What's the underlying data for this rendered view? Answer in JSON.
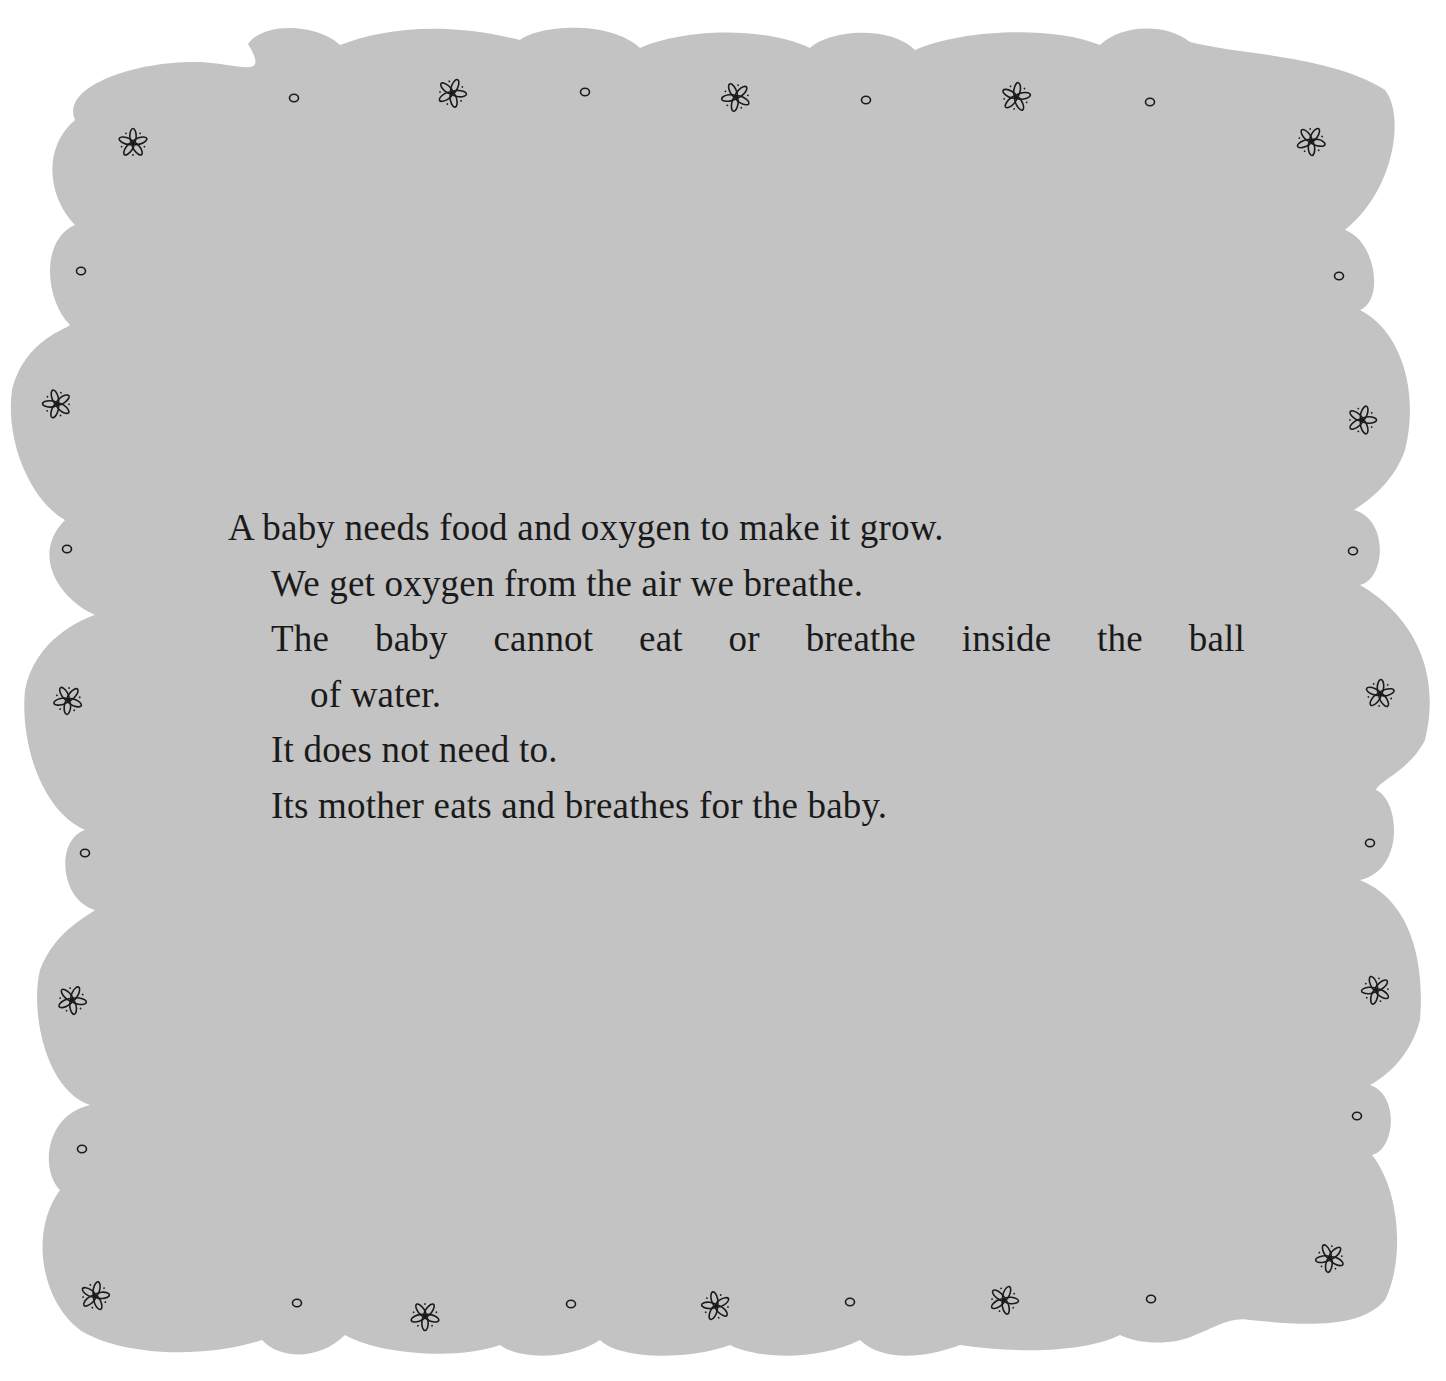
{
  "page": {
    "background_color": "#ffffff",
    "panel_color": "#c3c3c3",
    "ink_color": "#1a1a1a"
  },
  "text": {
    "lines": [
      "A baby needs food and oxygen to make it grow.",
      "We get oxygen from the air we breathe.",
      "The baby cannot eat or breathe inside the ball",
      "of water.",
      "It does not need to.",
      "Its mother eats and breathes for the baby."
    ]
  },
  "decorations": {
    "flower_icon": "six-petal-flower",
    "circle_icon": "small-circle",
    "flowers": [
      {
        "x": 133,
        "y": 143
      },
      {
        "x": 452,
        "y": 93
      },
      {
        "x": 736,
        "y": 97
      },
      {
        "x": 1016,
        "y": 97
      },
      {
        "x": 1311,
        "y": 141
      },
      {
        "x": 57,
        "y": 404
      },
      {
        "x": 1362,
        "y": 420
      },
      {
        "x": 68,
        "y": 700
      },
      {
        "x": 1380,
        "y": 694
      },
      {
        "x": 72,
        "y": 1000
      },
      {
        "x": 1376,
        "y": 990
      },
      {
        "x": 95,
        "y": 1296
      },
      {
        "x": 425,
        "y": 1316
      },
      {
        "x": 716,
        "y": 1306
      },
      {
        "x": 1004,
        "y": 1300
      },
      {
        "x": 1330,
        "y": 1258
      }
    ],
    "circles": [
      {
        "x": 294,
        "y": 98
      },
      {
        "x": 585,
        "y": 92
      },
      {
        "x": 866,
        "y": 100
      },
      {
        "x": 1150,
        "y": 102
      },
      {
        "x": 81,
        "y": 271
      },
      {
        "x": 1339,
        "y": 276
      },
      {
        "x": 67,
        "y": 549
      },
      {
        "x": 1353,
        "y": 551
      },
      {
        "x": 85,
        "y": 853
      },
      {
        "x": 1370,
        "y": 843
      },
      {
        "x": 82,
        "y": 1149
      },
      {
        "x": 1357,
        "y": 1116
      },
      {
        "x": 297,
        "y": 1303
      },
      {
        "x": 571,
        "y": 1304
      },
      {
        "x": 850,
        "y": 1302
      },
      {
        "x": 1151,
        "y": 1299
      }
    ]
  }
}
